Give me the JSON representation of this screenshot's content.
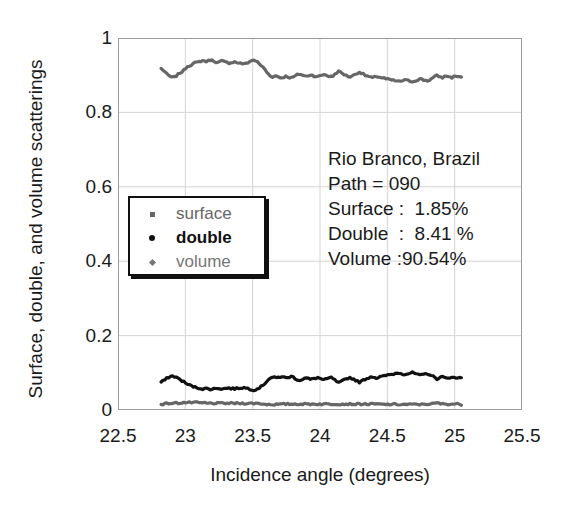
{
  "chart_data": {
    "type": "line",
    "title": "",
    "xlabel": "Incidence angle (degrees)",
    "ylabel": "Surface, double, and volume scatterings",
    "xlim": [
      22.5,
      25.5
    ],
    "ylim": [
      0,
      1
    ],
    "xticks": [
      "22.5",
      "23",
      "23.5",
      "24",
      "24.5",
      "25",
      "25.5"
    ],
    "yticks": [
      "0",
      "0.2",
      "0.4",
      "0.6",
      "0.8",
      "1"
    ],
    "grid": true,
    "legend_position": "center-left",
    "x_data_start": 22.82,
    "x_data_end": 25.05,
    "series": [
      {
        "name": "volume",
        "color": "#666666",
        "marker": "diamond",
        "values": [
          0.918,
          0.914,
          0.909,
          0.903,
          0.899,
          0.896,
          0.894,
          0.895,
          0.898,
          0.902,
          0.906,
          0.909,
          0.913,
          0.919,
          0.924,
          0.926,
          0.928,
          0.931,
          0.933,
          0.934,
          0.936,
          0.938,
          0.939,
          0.938,
          0.937,
          0.939,
          0.941,
          0.94,
          0.938,
          0.936,
          0.934,
          0.936,
          0.938,
          0.937,
          0.935,
          0.934,
          0.933,
          0.934,
          0.935,
          0.936,
          0.934,
          0.933,
          0.932,
          0.931,
          0.93,
          0.932,
          0.934,
          0.937,
          0.939,
          0.941,
          0.939,
          0.935,
          0.93,
          0.926,
          0.921,
          0.915,
          0.908,
          0.902,
          0.898,
          0.896,
          0.897,
          0.898,
          0.896,
          0.894,
          0.893,
          0.895,
          0.897,
          0.896,
          0.894,
          0.893,
          0.895,
          0.898,
          0.901,
          0.903,
          0.902,
          0.9,
          0.898,
          0.897,
          0.899,
          0.901,
          0.9,
          0.898,
          0.897,
          0.896,
          0.898,
          0.9,
          0.902,
          0.901,
          0.899,
          0.897,
          0.896,
          0.898,
          0.903,
          0.907,
          0.91,
          0.908,
          0.905,
          0.902,
          0.899,
          0.897,
          0.896,
          0.898,
          0.9,
          0.903,
          0.906,
          0.908,
          0.906,
          0.903,
          0.9,
          0.898,
          0.896,
          0.894,
          0.893,
          0.895,
          0.897,
          0.896,
          0.894,
          0.893,
          0.892,
          0.89,
          0.889,
          0.888,
          0.887,
          0.886,
          0.885,
          0.884,
          0.883,
          0.884,
          0.886,
          0.887,
          0.886,
          0.885,
          0.884,
          0.883,
          0.884,
          0.886,
          0.888,
          0.89,
          0.889,
          0.887,
          0.886,
          0.885,
          0.887,
          0.89,
          0.893,
          0.896,
          0.899,
          0.897,
          0.895,
          0.894,
          0.896,
          0.898,
          0.897,
          0.895,
          0.894,
          0.896,
          0.898,
          0.897,
          0.896,
          0.895
        ]
      },
      {
        "name": "double",
        "color": "#111111",
        "marker": "dot",
        "values": [
          0.075,
          0.078,
          0.081,
          0.085,
          0.088,
          0.09,
          0.091,
          0.09,
          0.088,
          0.085,
          0.082,
          0.079,
          0.076,
          0.072,
          0.069,
          0.067,
          0.065,
          0.063,
          0.061,
          0.06,
          0.059,
          0.058,
          0.057,
          0.057,
          0.058,
          0.057,
          0.056,
          0.056,
          0.057,
          0.058,
          0.059,
          0.058,
          0.057,
          0.057,
          0.058,
          0.059,
          0.059,
          0.058,
          0.058,
          0.057,
          0.058,
          0.059,
          0.059,
          0.06,
          0.06,
          0.059,
          0.058,
          0.056,
          0.055,
          0.054,
          0.055,
          0.057,
          0.06,
          0.063,
          0.067,
          0.072,
          0.078,
          0.083,
          0.086,
          0.088,
          0.087,
          0.086,
          0.088,
          0.089,
          0.09,
          0.088,
          0.086,
          0.087,
          0.089,
          0.09,
          0.088,
          0.085,
          0.082,
          0.08,
          0.081,
          0.083,
          0.085,
          0.086,
          0.084,
          0.082,
          0.083,
          0.085,
          0.086,
          0.087,
          0.085,
          0.083,
          0.081,
          0.082,
          0.084,
          0.086,
          0.087,
          0.085,
          0.08,
          0.076,
          0.073,
          0.075,
          0.078,
          0.081,
          0.084,
          0.086,
          0.087,
          0.085,
          0.083,
          0.08,
          0.077,
          0.075,
          0.077,
          0.08,
          0.083,
          0.085,
          0.087,
          0.089,
          0.09,
          0.088,
          0.086,
          0.087,
          0.089,
          0.09,
          0.091,
          0.093,
          0.094,
          0.095,
          0.096,
          0.097,
          0.098,
          0.099,
          0.1,
          0.099,
          0.097,
          0.096,
          0.097,
          0.098,
          0.099,
          0.1,
          0.099,
          0.097,
          0.095,
          0.093,
          0.094,
          0.096,
          0.097,
          0.098,
          0.096,
          0.093,
          0.09,
          0.087,
          0.084,
          0.086,
          0.088,
          0.089,
          0.087,
          0.085,
          0.086,
          0.088,
          0.089,
          0.087,
          0.085,
          0.086,
          0.087,
          0.088
        ]
      },
      {
        "name": "surface",
        "color": "#666666",
        "marker": "square",
        "values": [
          0.016,
          0.016,
          0.017,
          0.017,
          0.018,
          0.018,
          0.018,
          0.018,
          0.019,
          0.019,
          0.019,
          0.02,
          0.02,
          0.02,
          0.02,
          0.02,
          0.02,
          0.02,
          0.02,
          0.02,
          0.019,
          0.019,
          0.019,
          0.019,
          0.018,
          0.018,
          0.018,
          0.018,
          0.018,
          0.018,
          0.018,
          0.018,
          0.018,
          0.018,
          0.018,
          0.018,
          0.018,
          0.018,
          0.018,
          0.018,
          0.018,
          0.018,
          0.018,
          0.018,
          0.018,
          0.018,
          0.018,
          0.018,
          0.018,
          0.018,
          0.018,
          0.018,
          0.017,
          0.017,
          0.016,
          0.016,
          0.015,
          0.015,
          0.015,
          0.015,
          0.015,
          0.015,
          0.015,
          0.015,
          0.015,
          0.016,
          0.016,
          0.016,
          0.016,
          0.016,
          0.016,
          0.016,
          0.016,
          0.016,
          0.016,
          0.016,
          0.016,
          0.016,
          0.016,
          0.016,
          0.016,
          0.016,
          0.016,
          0.016,
          0.016,
          0.016,
          0.016,
          0.016,
          0.016,
          0.016,
          0.016,
          0.016,
          0.016,
          0.016,
          0.016,
          0.016,
          0.016,
          0.016,
          0.016,
          0.016,
          0.016,
          0.016,
          0.016,
          0.016,
          0.016,
          0.016,
          0.016,
          0.016,
          0.016,
          0.016,
          0.016,
          0.016,
          0.016,
          0.016,
          0.016,
          0.016,
          0.015,
          0.015,
          0.015,
          0.015,
          0.015,
          0.015,
          0.015,
          0.015,
          0.015,
          0.015,
          0.015,
          0.015,
          0.015,
          0.015,
          0.015,
          0.015,
          0.015,
          0.015,
          0.015,
          0.015,
          0.015,
          0.015,
          0.015,
          0.016,
          0.016,
          0.016,
          0.016,
          0.016,
          0.017,
          0.018,
          0.019,
          0.018,
          0.017,
          0.016,
          0.016,
          0.016,
          0.016,
          0.016,
          0.016,
          0.016,
          0.016,
          0.016,
          0.016,
          0.015
        ]
      }
    ]
  },
  "legend": {
    "items": [
      {
        "label": "surface",
        "marker": "square",
        "color": "#666666"
      },
      {
        "label": "double",
        "marker": "dot",
        "color": "#111111"
      },
      {
        "label": "volume",
        "marker": "diamond",
        "color": "#777777"
      }
    ]
  },
  "annotation": {
    "lines": [
      "Rio Branco, Brazil",
      "Path = 090",
      "Surface :  1.85%",
      "Double  :  8.41 %",
      "Volume :90.54%"
    ],
    "location": "Rio Branco, Brazil",
    "path": "Path = 090",
    "surface_pct": "Surface :  1.85%",
    "double_pct": "Double  :  8.41 %",
    "volume_pct": "Volume :90.54%"
  }
}
